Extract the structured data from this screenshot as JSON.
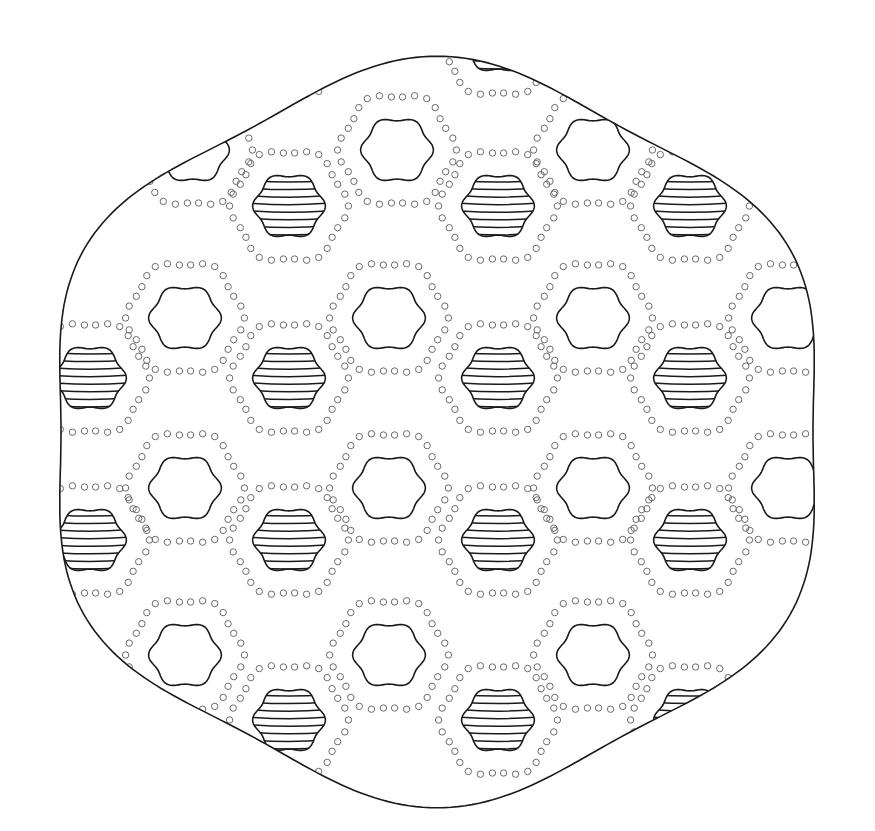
{
  "image": {
    "description": "Line-art pattern: wavy rounded-hexagonal outline clipping a hexagonal tiling of blobs surrounded by dotted rings; alternating blobs are striped",
    "width": 875,
    "height": 831
  },
  "colors": {
    "background": "#ffffff",
    "stroke": "#1a1a1a",
    "dots": "#6a6a6a"
  },
  "outline": {
    "center_x": 437,
    "center_y": 432,
    "radius": 390,
    "lobes": 6,
    "wobble": 14
  },
  "pattern": {
    "col_spacing": 104,
    "row_spacing": 170,
    "origin_x": 96,
    "origin_y": 100,
    "blob_radius": 34,
    "ring_radius": 56,
    "ring_dots": 30,
    "stripes": 9,
    "plain_blobs": [
      [
        193,
        150
      ],
      [
        397,
        150
      ],
      [
        593,
        150
      ],
      [
        185,
        318
      ],
      [
        389,
        318
      ],
      [
        593,
        318
      ],
      [
        788,
        318
      ],
      [
        185,
        488
      ],
      [
        389,
        488
      ],
      [
        593,
        488
      ],
      [
        788,
        488
      ],
      [
        185,
        655
      ],
      [
        389,
        655
      ],
      [
        593,
        655
      ]
    ],
    "striped_blobs": [
      [
        289,
        40
      ],
      [
        498,
        40
      ],
      [
        289,
        206
      ],
      [
        498,
        206
      ],
      [
        690,
        206
      ],
      [
        90,
        378
      ],
      [
        289,
        378
      ],
      [
        498,
        378
      ],
      [
        690,
        378
      ],
      [
        90,
        540
      ],
      [
        289,
        540
      ],
      [
        498,
        540
      ],
      [
        690,
        540
      ],
      [
        289,
        720
      ],
      [
        498,
        720
      ],
      [
        690,
        720
      ]
    ]
  }
}
